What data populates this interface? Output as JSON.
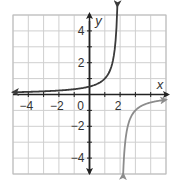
{
  "chart_data": {
    "type": "line",
    "title": "",
    "xlabel": "x",
    "ylabel": "y",
    "xlim": [
      -5,
      5
    ],
    "ylim": [
      -5,
      5
    ],
    "grid": true,
    "x_ticks": [
      -4,
      -2,
      0,
      2
    ],
    "y_ticks": [
      4,
      2,
      -2,
      -4
    ],
    "x_tick_labels": [
      "−4",
      "−2",
      "0",
      "2"
    ],
    "y_tick_labels": [
      "4",
      "2",
      "−2",
      "−4"
    ],
    "vertical_asymptote": 2,
    "horizontal_asymptote": 0,
    "series": [
      {
        "name": "left-branch",
        "color": "#3a3a3a",
        "function": "1/(2-x)",
        "x": [
          -5,
          -4,
          -3,
          -2,
          -1,
          0,
          1,
          1.5,
          1.8
        ],
        "y": [
          0.14,
          0.17,
          0.2,
          0.25,
          0.33,
          0.5,
          1,
          2,
          5
        ]
      },
      {
        "name": "right-branch",
        "color": "#8c8c8c",
        "function": "1/(2-x)",
        "x": [
          2.2,
          2.5,
          3,
          4,
          5
        ],
        "y": [
          -5,
          -2,
          -1,
          -0.5,
          -0.33
        ]
      }
    ]
  },
  "labels": {
    "x_axis": "x",
    "y_axis": "y"
  }
}
